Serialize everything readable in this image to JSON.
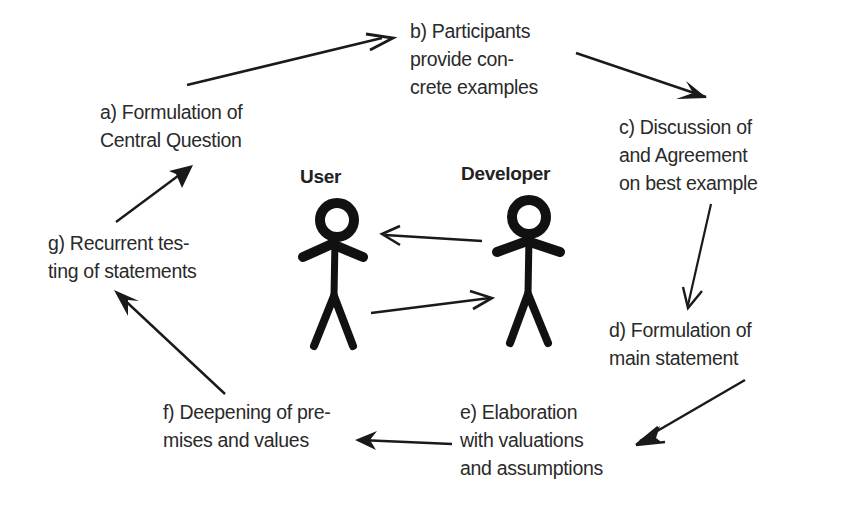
{
  "diagram": {
    "type": "cyclic-process",
    "actors": [
      {
        "id": "user",
        "name": "User"
      },
      {
        "id": "developer",
        "name": "Developer"
      }
    ],
    "steps": [
      {
        "id": "a",
        "lines": [
          "a) Formulation of",
          "Central Question"
        ]
      },
      {
        "id": "b",
        "lines": [
          "b) Participants",
          "provide con-",
          "crete examples"
        ]
      },
      {
        "id": "c",
        "lines": [
          "c) Discussion of",
          "and Agreement",
          "on best example"
        ]
      },
      {
        "id": "d",
        "lines": [
          "d) Formulation of",
          "main statement"
        ]
      },
      {
        "id": "e",
        "lines": [
          "e) Elaboration",
          "with valuations",
          "and assumptions"
        ]
      },
      {
        "id": "f",
        "lines": [
          "f) Deepening of pre-",
          "mises and values"
        ]
      },
      {
        "id": "g",
        "lines": [
          "g) Recurrent tes-",
          "ting of statements"
        ]
      }
    ],
    "flow": [
      {
        "from": "a",
        "to": "b"
      },
      {
        "from": "b",
        "to": "c"
      },
      {
        "from": "c",
        "to": "d"
      },
      {
        "from": "d",
        "to": "e"
      },
      {
        "from": "e",
        "to": "f"
      },
      {
        "from": "f",
        "to": "g"
      },
      {
        "from": "g",
        "to": "a"
      },
      {
        "from": "developer",
        "to": "user"
      },
      {
        "from": "user",
        "to": "developer"
      }
    ],
    "colors": {
      "stroke": "#1a1a1a",
      "text": "#2a2a2a",
      "background": "#ffffff"
    }
  }
}
